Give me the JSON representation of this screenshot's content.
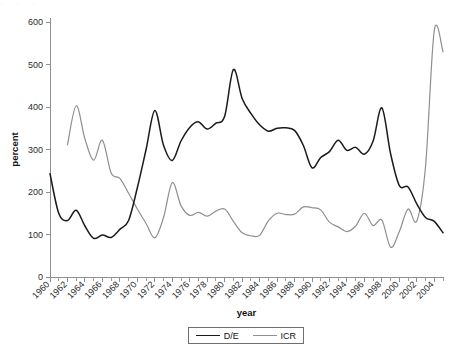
{
  "figure": {
    "top_artifact_text": "·      ·  ·",
    "background_color": "#ffffff"
  },
  "legend": {
    "position": "bottom-center",
    "entries": [
      {
        "label": "D/E",
        "color": "#1a1a1a"
      },
      {
        "label": "ICR",
        "color": "#8e8e93"
      }
    ]
  },
  "chart_data": {
    "type": "line",
    "title": "",
    "xlabel": "year",
    "ylabel": "percent",
    "xlim": [
      1960,
      2005
    ],
    "ylim": [
      0,
      600
    ],
    "y_ticks": [
      0,
      100,
      200,
      300,
      400,
      500,
      600
    ],
    "x_ticks_major": [
      1960,
      1962,
      1964,
      1966,
      1968,
      1970,
      1972,
      1974,
      1976,
      1978,
      1980,
      1982,
      1984,
      1986,
      1988,
      1990,
      1992,
      1994,
      1996,
      1998,
      2000,
      2002,
      2004
    ],
    "x_tick_minor_step": 1,
    "x_tick_label_rotation": -45,
    "grid": false,
    "legend_position": "bottom-center",
    "x": [
      1960,
      1961,
      1962,
      1963,
      1964,
      1965,
      1966,
      1967,
      1968,
      1969,
      1970,
      1971,
      1972,
      1973,
      1974,
      1975,
      1976,
      1977,
      1978,
      1979,
      1980,
      1981,
      1982,
      1983,
      1984,
      1985,
      1986,
      1987,
      1988,
      1989,
      1990,
      1991,
      1992,
      1993,
      1994,
      1995,
      1996,
      1997,
      1998,
      1999,
      2000,
      2001,
      2002,
      2003,
      2004,
      2005
    ],
    "series": [
      {
        "name": "D/E",
        "color": "#1a1a1a",
        "values": [
          243,
          150,
          133,
          157,
          120,
          91,
          99,
          93,
          112,
          133,
          210,
          300,
          392,
          310,
          274,
          320,
          352,
          365,
          348,
          362,
          378,
          488,
          420,
          385,
          358,
          343,
          350,
          351,
          345,
          310,
          257,
          281,
          295,
          322,
          298,
          305,
          289,
          320,
          398,
          290,
          215,
          212,
          172,
          140,
          131,
          104
        ]
      },
      {
        "name": "ICR",
        "color": "#8e8e93",
        "values": [
          null,
          null,
          311,
          403,
          325,
          275,
          322,
          245,
          232,
          197,
          160,
          126,
          92,
          140,
          222,
          168,
          145,
          152,
          143,
          155,
          160,
          131,
          104,
          97,
          98,
          132,
          150,
          147,
          148,
          165,
          163,
          158,
          129,
          118,
          107,
          120,
          150,
          121,
          134,
          70,
          107,
          160,
          132,
          260,
          580,
          530
        ]
      }
    ]
  }
}
